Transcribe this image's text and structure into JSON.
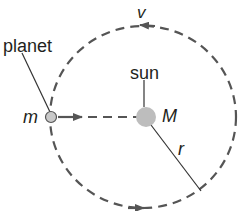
{
  "diagram": {
    "type": "circular-orbit",
    "labels": {
      "planet": "planet",
      "sun": "sun",
      "planet_mass": "m",
      "sun_mass": "M",
      "radius": "r",
      "velocity": "v"
    },
    "colors": {
      "orbit": "#555555",
      "sun": "#bdbdbd",
      "planet": "#c9c9c9",
      "line": "#333333",
      "background": "#ffffff"
    }
  }
}
